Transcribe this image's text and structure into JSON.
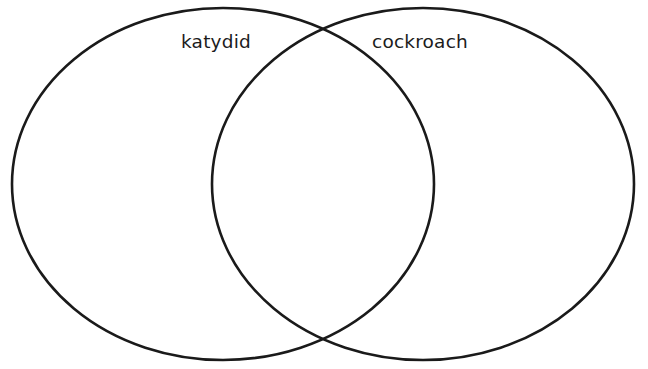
{
  "diagram": {
    "type": "venn",
    "title": "",
    "background_color": "#ffffff",
    "stroke_color": "#1a1a1a",
    "stroke_width": 2.6,
    "fill": "none",
    "sets": [
      {
        "id": "left",
        "label": "katydid",
        "label_color": "#1c1c1c",
        "shape": "ellipse",
        "cx": 223,
        "cy": 184,
        "rx": 211,
        "ry": 176,
        "label_x": 216,
        "label_y": 48
      },
      {
        "id": "right",
        "label": "cockroach",
        "label_color": "#1c1c1c",
        "shape": "ellipse",
        "cx": 423,
        "cy": 184,
        "rx": 211,
        "ry": 176,
        "label_x": 420,
        "label_y": 48
      }
    ],
    "intersection": {
      "label": "",
      "top_point_x": 322,
      "top_point_y": 33,
      "bottom_point_x": 322,
      "bottom_point_y": 335
    }
  }
}
